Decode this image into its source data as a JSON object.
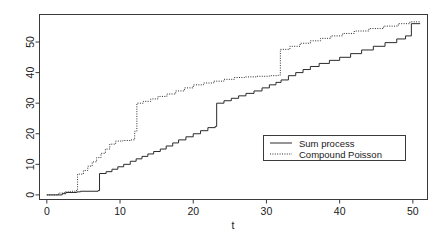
{
  "chart_data": {
    "type": "line",
    "title": "",
    "subtitle": "",
    "xlabel": "t",
    "ylabel": "",
    "xlim": [
      -1,
      52
    ],
    "ylim": [
      -1.5,
      59
    ],
    "xticks": [
      0,
      10,
      20,
      30,
      40,
      50
    ],
    "xticklabels": [
      "0",
      "10",
      "20",
      "30",
      "40",
      "50"
    ],
    "yticks": [
      0,
      10,
      20,
      30,
      40,
      50
    ],
    "yticklabels": [
      "0",
      "10",
      "20",
      "30",
      "40",
      "50"
    ],
    "grid": false,
    "legend_position": "center-right",
    "step_type": "post",
    "series": [
      {
        "name": "Sum process",
        "linestyle": "solid",
        "color": "#2b2b2b",
        "x": [
          0,
          2.1,
          2.6,
          4.1,
          4.6,
          7.0,
          7.2,
          8.1,
          8.9,
          9.7,
          10.5,
          11.4,
          12.2,
          13.0,
          13.8,
          14.6,
          15.5,
          16.3,
          17.2,
          18.0,
          19.0,
          20.0,
          21.0,
          22.0,
          23.0,
          23.2,
          24.2,
          25.2,
          26.2,
          27.2,
          28.3,
          29.4,
          30.4,
          31.3,
          32.0,
          33.0,
          34.0,
          35.0,
          36.0,
          37.2,
          38.6,
          40.0,
          41.5,
          43.0,
          44.6,
          46.2,
          47.8,
          49.0,
          49.8,
          51.0
        ],
        "y": [
          0,
          0.4,
          0.8,
          1.0,
          1.2,
          1.4,
          7.0,
          7.6,
          8.4,
          9.2,
          10.0,
          11.0,
          11.8,
          12.6,
          13.4,
          14.2,
          15.0,
          16.0,
          17.0,
          18.0,
          19.0,
          20.0,
          21.0,
          22.0,
          22.4,
          30.0,
          30.8,
          31.6,
          32.4,
          33.2,
          34.0,
          35.0,
          36.0,
          36.8,
          37.6,
          39.0,
          40.0,
          41.0,
          42.0,
          43.0,
          44.0,
          45.0,
          46.2,
          47.4,
          48.6,
          49.8,
          51.0,
          52.0,
          56.0,
          56.0
        ]
      },
      {
        "name": "Compound Poisson",
        "linestyle": "dotted",
        "color": "#2b2b2b",
        "x": [
          0,
          1.6,
          2.4,
          3.2,
          4.0,
          4.2,
          5.0,
          5.6,
          6.2,
          6.8,
          7.4,
          8.0,
          8.6,
          9.4,
          10.4,
          11.4,
          12.0,
          12.3,
          13.2,
          14.2,
          15.2,
          16.4,
          17.6,
          18.8,
          20.0,
          21.4,
          22.8,
          24.2,
          25.6,
          27.0,
          28.6,
          30.4,
          31.6,
          31.9,
          33.2,
          34.6,
          36.0,
          37.4,
          38.8,
          40.4,
          42.0,
          44.0,
          46.0,
          48.0,
          49.6,
          51.0
        ],
        "y": [
          0,
          0.6,
          1.0,
          1.2,
          1.4,
          6.8,
          8.0,
          9.4,
          10.8,
          12.2,
          13.6,
          15.0,
          16.6,
          17.6,
          17.8,
          18.0,
          20.8,
          30.0,
          30.6,
          31.4,
          32.2,
          33.0,
          34.0,
          35.0,
          36.0,
          36.6,
          37.2,
          37.8,
          38.4,
          38.6,
          38.8,
          39.0,
          39.2,
          47.6,
          48.6,
          49.6,
          50.4,
          51.2,
          52.0,
          52.8,
          53.6,
          54.4,
          55.2,
          56.0,
          56.6,
          56.6
        ]
      }
    ],
    "legend": [
      {
        "label": "Sum process",
        "linestyle": "solid"
      },
      {
        "label": "Compound Poisson",
        "linestyle": "dotted"
      }
    ]
  }
}
